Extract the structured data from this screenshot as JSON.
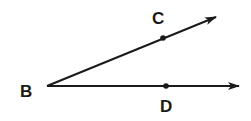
{
  "diagram": {
    "type": "geometry-angle",
    "stroke_color": "#1a1a1a",
    "vertex": {
      "label": "B",
      "x": 47,
      "y": 86,
      "label_x": 20,
      "label_y": 97
    },
    "rays": [
      {
        "name": "ray-BC",
        "from": "B",
        "through": "C",
        "x1": 47,
        "y1": 86,
        "x2": 216,
        "y2": 17
      },
      {
        "name": "ray-BD",
        "from": "B",
        "through": "D",
        "x1": 47,
        "y1": 86,
        "x2": 239,
        "y2": 86
      }
    ],
    "points": [
      {
        "label": "C",
        "x": 163,
        "y": 38,
        "label_x": 152,
        "label_y": 24
      },
      {
        "label": "D",
        "x": 166,
        "y": 86,
        "label_x": 160,
        "label_y": 112
      }
    ]
  }
}
